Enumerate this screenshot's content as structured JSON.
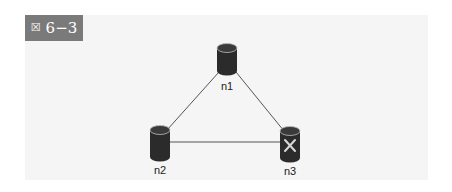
{
  "figure": {
    "label_icon": "boxed-x-glyph",
    "label_icon_char": "☒",
    "label": "6-3",
    "label_display": "6−3"
  },
  "diagram": {
    "type": "network-topology",
    "nodes": [
      {
        "id": "n1",
        "label": "n1",
        "icon": "database-cylinder-icon",
        "status": "normal"
      },
      {
        "id": "n2",
        "label": "n2",
        "icon": "database-cylinder-icon",
        "status": "normal"
      },
      {
        "id": "n3",
        "label": "n3",
        "icon": "database-cylinder-failed-icon",
        "status": "failed"
      }
    ],
    "edges": [
      {
        "from": "n1",
        "to": "n2"
      },
      {
        "from": "n1",
        "to": "n3"
      },
      {
        "from": "n2",
        "to": "n3"
      }
    ]
  },
  "colors": {
    "panel_bg": "#f5f5f5",
    "label_bg": "#7a7a7a",
    "node_fill": "#2b2b2b",
    "edge": "#555555"
  }
}
